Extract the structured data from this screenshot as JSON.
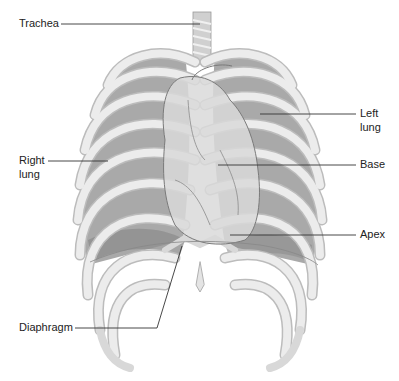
{
  "figure": {
    "labels": {
      "trachea": "Trachea",
      "left_lung_1": "Left",
      "left_lung_2": "lung",
      "right_lung_1": "Right",
      "right_lung_2": "lung",
      "base": "Base",
      "apex": "Apex",
      "diaphragm": "Diaphragm"
    },
    "colors": {
      "lung": "#a9a9a9",
      "rib": "#e6e6e6",
      "rib_edge": "#bcbcbc",
      "heart": "#d9d9d9",
      "heart_outline": "#7a7a7a",
      "leader_line": "#333333",
      "diaphragm_shadow": "#8e8e8e"
    }
  }
}
